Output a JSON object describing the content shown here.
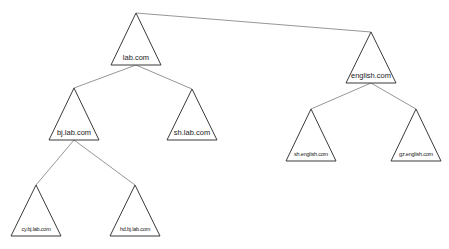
{
  "diagram": {
    "type": "domain-tree",
    "nodes": [
      {
        "id": "lab",
        "label": "lab.com",
        "apex": [
          136,
          13
        ],
        "base_y": 65,
        "half_width": 25,
        "size": "big"
      },
      {
        "id": "english",
        "label": "english.com",
        "apex": [
          371,
          32
        ],
        "base_y": 83,
        "half_width": 25,
        "size": "big"
      },
      {
        "id": "bj",
        "label": "bj.lab.com",
        "apex": [
          74,
          88
        ],
        "base_y": 140,
        "half_width": 25,
        "size": "big"
      },
      {
        "id": "sh",
        "label": "sh.lab.com",
        "apex": [
          192,
          89
        ],
        "base_y": 140,
        "half_width": 25,
        "size": "big"
      },
      {
        "id": "sh_english",
        "label": "sh.english.com",
        "apex": [
          311,
          109
        ],
        "base_y": 161,
        "half_width": 25,
        "size": "small"
      },
      {
        "id": "gz_english",
        "label": "gz.english.com",
        "apex": [
          416,
          109
        ],
        "base_y": 161,
        "half_width": 25,
        "size": "small"
      },
      {
        "id": "cy_bj",
        "label": "cy.bj.lab.com",
        "apex": [
          36,
          185
        ],
        "base_y": 236,
        "half_width": 25,
        "size": "small"
      },
      {
        "id": "hd_bj",
        "label": "hd.bj.lab.com",
        "apex": [
          135,
          185
        ],
        "base_y": 236,
        "half_width": 25,
        "size": "small"
      }
    ],
    "edges": [
      {
        "from": "lab",
        "to": "english",
        "from_point": "apex",
        "to_point": "apex"
      },
      {
        "from": "lab",
        "to": "bj",
        "from_point": "base",
        "to_point": "apex"
      },
      {
        "from": "lab",
        "to": "sh",
        "from_point": "base",
        "to_point": "apex"
      },
      {
        "from": "english",
        "to": "sh_english",
        "from_point": "base",
        "to_point": "apex"
      },
      {
        "from": "english",
        "to": "gz_english",
        "from_point": "base",
        "to_point": "apex"
      },
      {
        "from": "bj",
        "to": "cy_bj",
        "from_point": "base",
        "to_point": "apex"
      },
      {
        "from": "bj",
        "to": "hd_bj",
        "from_point": "base",
        "to_point": "apex"
      }
    ]
  }
}
